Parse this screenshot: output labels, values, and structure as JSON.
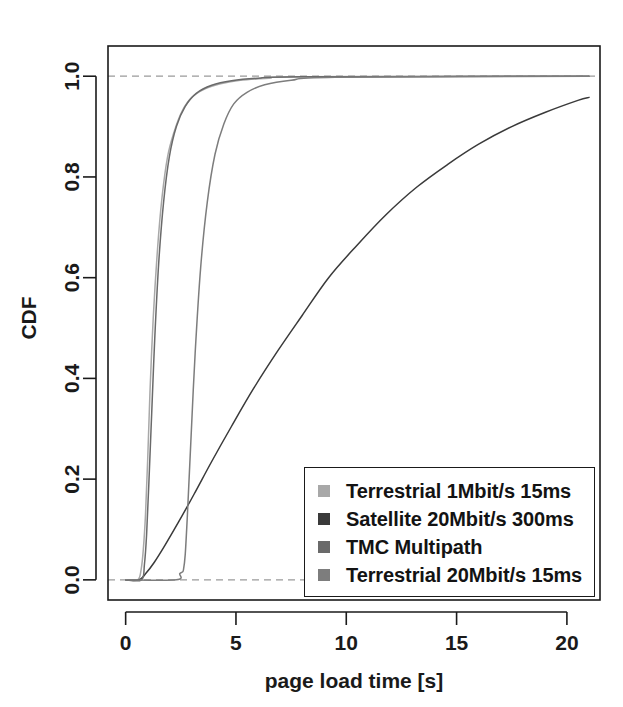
{
  "chart_data": {
    "type": "line",
    "title": "",
    "xlabel": "page load time [s]",
    "ylabel": "CDF",
    "xlim": [
      -0.8,
      21.5
    ],
    "ylim": [
      -0.04,
      1.06
    ],
    "xticks": [
      "0",
      "5",
      "10",
      "15",
      "20"
    ],
    "xtick_values": [
      0,
      5,
      10,
      15,
      20
    ],
    "yticks": [
      "0.0",
      "0.2",
      "0.4",
      "0.6",
      "0.8",
      "1.0"
    ],
    "ytick_values": [
      0.0,
      0.2,
      0.4,
      0.6,
      0.8,
      1.0
    ],
    "grid": false,
    "reference_lines": [
      {
        "axis": "y",
        "value": 0.0,
        "style": "dashed",
        "color": "#9a9a9a"
      },
      {
        "axis": "y",
        "value": 1.0,
        "style": "dashed",
        "color": "#9a9a9a"
      }
    ],
    "legend_position": "bottom-right",
    "series": [
      {
        "name": "Terrestrial 1Mbit/s 15ms",
        "color": "#a8a8a8",
        "x": [
          0.0,
          0.55,
          0.7,
          0.8,
          0.9,
          1.0,
          1.1,
          1.25,
          1.45,
          1.65,
          1.9,
          2.2,
          2.55,
          3.0,
          3.6,
          4.3,
          5.2,
          6.5,
          8.0,
          21.0
        ],
        "y": [
          0.0,
          0.0,
          0.02,
          0.06,
          0.13,
          0.24,
          0.37,
          0.52,
          0.66,
          0.76,
          0.84,
          0.89,
          0.93,
          0.958,
          0.975,
          0.985,
          0.992,
          0.996,
          0.999,
          1.0
        ]
      },
      {
        "name": "Satellite 20Mbit/s 300ms",
        "color": "#3a3a3a",
        "x": [
          0.0,
          0.6,
          0.9,
          1.3,
          1.8,
          2.4,
          3.1,
          3.9,
          4.8,
          5.8,
          6.9,
          8.0,
          9.2,
          10.5,
          11.8,
          13.2,
          14.6,
          16.0,
          17.5,
          19.0,
          20.5,
          21.0
        ],
        "y": [
          0.0,
          0.0,
          0.012,
          0.035,
          0.07,
          0.115,
          0.17,
          0.235,
          0.305,
          0.38,
          0.455,
          0.525,
          0.6,
          0.665,
          0.725,
          0.78,
          0.825,
          0.865,
          0.9,
          0.928,
          0.952,
          0.958
        ]
      },
      {
        "name": "TMC Multipath",
        "color": "#6a6a6a",
        "x": [
          0.0,
          0.72,
          0.85,
          0.95,
          1.05,
          1.18,
          1.32,
          1.5,
          1.72,
          1.98,
          2.3,
          2.7,
          3.2,
          3.9,
          4.8,
          6.0,
          8.0,
          21.0
        ],
        "y": [
          0.0,
          0.0,
          0.03,
          0.09,
          0.19,
          0.33,
          0.48,
          0.63,
          0.75,
          0.84,
          0.9,
          0.94,
          0.966,
          0.982,
          0.991,
          0.996,
          0.999,
          1.0
        ]
      },
      {
        "name": "Terrestrial 20Mbit/s 15ms",
        "color": "#7d7d7d",
        "x": [
          0.0,
          2.3,
          2.45,
          2.55,
          2.62,
          2.7,
          2.8,
          2.95,
          3.15,
          3.4,
          3.7,
          4.05,
          4.45,
          4.9,
          5.5,
          6.3,
          7.5,
          9.5,
          21.0
        ],
        "y": [
          0.0,
          0.0,
          0.012,
          0.015,
          0.02,
          0.05,
          0.13,
          0.27,
          0.45,
          0.62,
          0.75,
          0.845,
          0.905,
          0.945,
          0.968,
          0.983,
          0.992,
          0.998,
          1.0
        ]
      }
    ]
  },
  "axes": {
    "ylabel_text": "CDF",
    "xlabel_text": "page load time [s]"
  },
  "legend": {
    "entries": [
      {
        "label": "Terrestrial 1Mbit/s 15ms",
        "color": "#a8a8a8"
      },
      {
        "label": "Satellite 20Mbit/s 300ms",
        "color": "#3a3a3a"
      },
      {
        "label": "TMC Multipath",
        "color": "#6a6a6a"
      },
      {
        "label": "Terrestrial 20Mbit/s 15ms",
        "color": "#7d7d7d"
      }
    ]
  }
}
